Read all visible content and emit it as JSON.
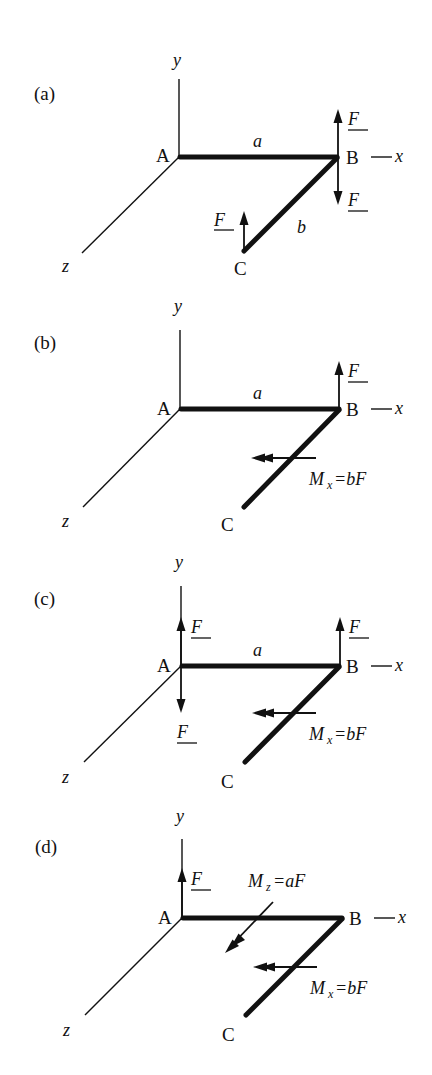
{
  "figure": {
    "panels": [
      {
        "id": "a",
        "label": "(a)",
        "axes": {
          "y": "y",
          "x": "x",
          "z": "z"
        },
        "points": {
          "A": "A",
          "B": "B",
          "C": "C"
        },
        "dimensions": {
          "AB": "a",
          "BC": "b"
        },
        "forces": [
          {
            "at": "B",
            "direction": "up",
            "label": "F"
          },
          {
            "at": "B",
            "direction": "down",
            "label": "F"
          },
          {
            "at": "C",
            "direction": "up",
            "label": "F"
          }
        ],
        "moments": []
      },
      {
        "id": "b",
        "label": "(b)",
        "axes": {
          "y": "y",
          "x": "x",
          "z": "z"
        },
        "points": {
          "A": "A",
          "B": "B",
          "C": "C"
        },
        "dimensions": {
          "AB": "a"
        },
        "forces": [
          {
            "at": "B",
            "direction": "up",
            "label": "F"
          }
        ],
        "moments": [
          {
            "axis": "x",
            "label_main": "M",
            "label_sub": "x",
            "label_rhs": "=bF"
          }
        ]
      },
      {
        "id": "c",
        "label": "(c)",
        "axes": {
          "y": "y",
          "x": "x",
          "z": "z"
        },
        "points": {
          "A": "A",
          "B": "B",
          "C": "C"
        },
        "dimensions": {
          "AB": "a"
        },
        "forces": [
          {
            "at": "A",
            "direction": "up",
            "label": "F"
          },
          {
            "at": "A",
            "direction": "down",
            "label": "F"
          },
          {
            "at": "B",
            "direction": "up",
            "label": "F"
          }
        ],
        "moments": [
          {
            "axis": "x",
            "label_main": "M",
            "label_sub": "x",
            "label_rhs": "=bF"
          }
        ]
      },
      {
        "id": "d",
        "label": "(d)",
        "axes": {
          "y": "y",
          "x": "x",
          "z": "z"
        },
        "points": {
          "A": "A",
          "B": "B",
          "C": "C"
        },
        "dimensions": {},
        "forces": [
          {
            "at": "A",
            "direction": "up",
            "label": "F"
          }
        ],
        "moments": [
          {
            "axis": "z",
            "label_main": "M",
            "label_sub": "z",
            "label_rhs": "=aF"
          },
          {
            "axis": "x",
            "label_main": "M",
            "label_sub": "x",
            "label_rhs": "=bF"
          }
        ]
      }
    ],
    "x_axis_prefix": "—"
  }
}
